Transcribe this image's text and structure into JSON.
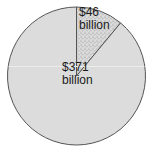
{
  "chart_data": {
    "type": "pie",
    "title": "",
    "categories": [
      "$46 billion",
      "$371 billion"
    ],
    "values": [
      46,
      371
    ],
    "units": "billion USD",
    "start_angle_deg": 0,
    "direction": "clockwise",
    "slices": [
      {
        "label_line1": "$46",
        "label_line2": "billion",
        "value": 46,
        "fill": "#d2d2d2",
        "pattern": "stipple"
      },
      {
        "label_line1": "$371",
        "label_line2": "billion",
        "value": 371,
        "fill": "#dcdcdc",
        "pattern": "none"
      }
    ],
    "legend": "none",
    "grid": false
  },
  "colors": {
    "outline": "#555555",
    "large_fill": "#dcdcdc",
    "small_fill": "#d6d6d6",
    "stipple": "#9a9a9a"
  }
}
